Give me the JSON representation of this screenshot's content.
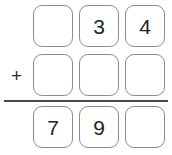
{
  "problem": {
    "type": "vertical-addition",
    "operator": "+",
    "columns": 3,
    "rows": [
      {
        "name": "addend-1",
        "operator": "",
        "cells": [
          {
            "value": "",
            "filled": false
          },
          {
            "value": "3",
            "filled": true
          },
          {
            "value": "4",
            "filled": true
          }
        ]
      },
      {
        "name": "addend-2",
        "operator": "+",
        "cells": [
          {
            "value": "",
            "filled": false
          },
          {
            "value": "",
            "filled": false
          },
          {
            "value": "",
            "filled": false
          }
        ]
      },
      {
        "name": "sum",
        "operator": "",
        "cells": [
          {
            "value": "7",
            "filled": true
          },
          {
            "value": "9",
            "filled": true
          },
          {
            "value": "",
            "filled": false
          }
        ]
      }
    ]
  },
  "colors": {
    "background": "#ffffff",
    "box_border": "#8d8d8d",
    "digit": "#232323",
    "operator": "#2b2b2b",
    "rule": "#4a4a4a"
  }
}
